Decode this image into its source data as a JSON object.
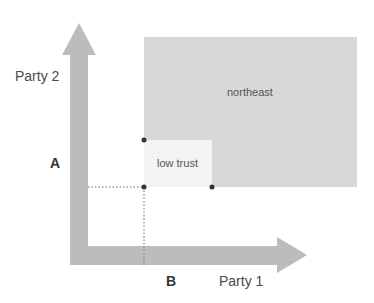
{
  "diagram": {
    "y_axis": {
      "label": "Party 2",
      "marker": "A"
    },
    "x_axis": {
      "label": "Party 1",
      "marker": "B"
    },
    "regions": {
      "northeast": {
        "label": "northeast",
        "color": "#d8d8d8"
      },
      "low_trust": {
        "label": "low trust",
        "color": "#f3f3f3"
      }
    },
    "colors": {
      "arrow": "#bcbcbc",
      "dot": "#333333",
      "dotted_line": "#666666"
    }
  }
}
